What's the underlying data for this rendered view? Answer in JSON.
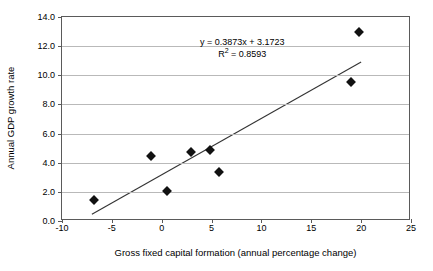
{
  "chart_data": {
    "type": "scatter",
    "title": "",
    "xlabel": "Gross fixed capital formation (annual percentage change)",
    "ylabel": "Annual GDP growth rate",
    "xlim": [
      -10,
      25
    ],
    "ylim": [
      0.0,
      14.0
    ],
    "xticks": [
      "-10",
      "-5",
      "0",
      "5",
      "10",
      "15",
      "20",
      "25"
    ],
    "xtick_values": [
      -10,
      -5,
      0,
      5,
      10,
      15,
      20,
      25
    ],
    "yticks": [
      "0.0",
      "2.0",
      "4.0",
      "6.0",
      "8.0",
      "10.0",
      "12.0",
      "14.0"
    ],
    "ytick_values": [
      0.0,
      2.0,
      4.0,
      6.0,
      8.0,
      10.0,
      12.0,
      14.0
    ],
    "grid": "horizontal",
    "legend": "none",
    "marker_style": "diamond",
    "marker_color": "#111111",
    "points": [
      {
        "x": -6.8,
        "y": 1.45
      },
      {
        "x": -1.1,
        "y": 4.45
      },
      {
        "x": 0.5,
        "y": 2.05
      },
      {
        "x": 2.9,
        "y": 4.75
      },
      {
        "x": 4.8,
        "y": 4.85
      },
      {
        "x": 5.7,
        "y": 3.35
      },
      {
        "x": 19.0,
        "y": 9.55
      },
      {
        "x": 19.8,
        "y": 12.95
      }
    ],
    "trendline": {
      "type": "linear",
      "slope": 0.3873,
      "intercept": 3.1723,
      "r_squared": 0.8593,
      "x_start": -7.0,
      "x_end": 20.0,
      "color": "#333333",
      "equation_label": "y = 0.3873x + 3.1723",
      "r2_label_prefix": "R",
      "r2_label_sup": "2",
      "r2_label_value": " = 0.8593"
    }
  }
}
